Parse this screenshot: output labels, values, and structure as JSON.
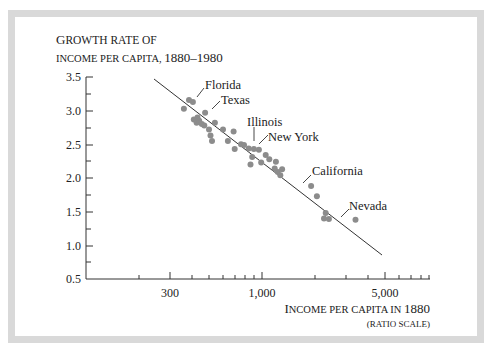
{
  "chart_data": {
    "type": "scatter",
    "title": "",
    "ylabel_line1": "Growth rate of",
    "ylabel_line2": "income per capita, 1880–1980",
    "xlabel_line1": "Income per capita in 1880",
    "xlabel_line2": "(ratio scale)",
    "xscale": "log",
    "xlim": [
      150,
      8000
    ],
    "ylim": [
      0.5,
      3.5
    ],
    "x_ticks": [
      {
        "value": 300,
        "label": "300"
      },
      {
        "value": 1000,
        "label": "1,000"
      },
      {
        "value": 5000,
        "label": "5,000"
      }
    ],
    "y_ticks": [
      {
        "value": 0.5,
        "label": "0.5"
      },
      {
        "value": 1.0,
        "label": "1.0"
      },
      {
        "value": 1.5,
        "label": "1.5"
      },
      {
        "value": 2.0,
        "label": "2.0"
      },
      {
        "value": 2.5,
        "label": "2.5"
      },
      {
        "value": 3.0,
        "label": "3.0"
      },
      {
        "value": 3.5,
        "label": "3.5"
      }
    ],
    "regression_line": {
      "x": [
        340,
        6400
      ],
      "y": [
        3.47,
        0.86
      ]
    },
    "points": [
      {
        "x": 385,
        "y": 3.16,
        "label": "Florida"
      },
      {
        "x": 405,
        "y": 3.13
      },
      {
        "x": 475,
        "y": 2.97,
        "label": "Texas"
      },
      {
        "x": 360,
        "y": 3.03
      },
      {
        "x": 410,
        "y": 2.87
      },
      {
        "x": 425,
        "y": 2.82
      },
      {
        "x": 440,
        "y": 2.85
      },
      {
        "x": 455,
        "y": 2.8
      },
      {
        "x": 470,
        "y": 2.78
      },
      {
        "x": 430,
        "y": 2.9
      },
      {
        "x": 500,
        "y": 2.72
      },
      {
        "x": 540,
        "y": 2.82
      },
      {
        "x": 510,
        "y": 2.63
      },
      {
        "x": 520,
        "y": 2.55
      },
      {
        "x": 600,
        "y": 2.72
      },
      {
        "x": 640,
        "y": 2.55
      },
      {
        "x": 690,
        "y": 2.69
      },
      {
        "x": 700,
        "y": 2.43
      },
      {
        "x": 760,
        "y": 2.5
      },
      {
        "x": 790,
        "y": 2.49
      },
      {
        "x": 840,
        "y": 2.44
      },
      {
        "x": 900,
        "y": 2.43,
        "label": "Illinois"
      },
      {
        "x": 960,
        "y": 2.42,
        "label": "New York"
      },
      {
        "x": 880,
        "y": 2.31
      },
      {
        "x": 860,
        "y": 2.2
      },
      {
        "x": 990,
        "y": 2.23
      },
      {
        "x": 1050,
        "y": 2.34
      },
      {
        "x": 1100,
        "y": 2.28
      },
      {
        "x": 1180,
        "y": 2.14
      },
      {
        "x": 1230,
        "y": 2.09
      },
      {
        "x": 1270,
        "y": 2.04
      },
      {
        "x": 1200,
        "y": 2.24
      },
      {
        "x": 1300,
        "y": 2.13
      },
      {
        "x": 1900,
        "y": 1.88,
        "label": "California"
      },
      {
        "x": 2050,
        "y": 1.73
      },
      {
        "x": 2300,
        "y": 1.48
      },
      {
        "x": 2250,
        "y": 1.4
      },
      {
        "x": 2400,
        "y": 1.39
      },
      {
        "x": 3400,
        "y": 1.38,
        "label": "Nevada"
      }
    ],
    "annotations": [
      "Florida",
      "Texas",
      "Illinois",
      "New York",
      "California",
      "Nevada"
    ]
  },
  "labels": {
    "ylabel_line1": "Growth rate of",
    "ylabel_line2": "income per capita, 1880–1980",
    "xlabel_line1": "Income per capita in 1880",
    "xlabel_line2": "(ratio scale)",
    "florida": "Florida",
    "texas": "Texas",
    "illinois": "Illinois",
    "new_york": "New York",
    "california": "California",
    "nevada": "Nevada",
    "y_3_5": "3.5",
    "y_3_0": "3.0",
    "y_2_5": "2.5",
    "y_2_0": "2.0",
    "y_1_5": "1.5",
    "y_1_0": "1.0",
    "y_0_5": "0.5",
    "x_300": "300",
    "x_1000": "1,000",
    "x_5000": "5,000"
  },
  "colors": {
    "frame": "#d9d9d9",
    "dot": "#8c8c8c",
    "axis": "#333333",
    "line": "#333333"
  }
}
